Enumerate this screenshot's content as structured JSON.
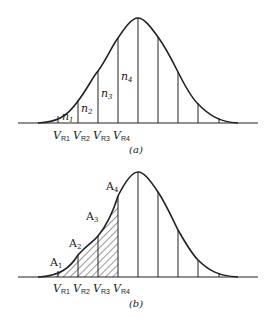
{
  "panel_a": {
    "caption": "(a)",
    "region_labels": [
      {
        "base": "n",
        "sub": "1"
      },
      {
        "base": "n",
        "sub": "2"
      },
      {
        "base": "n",
        "sub": "3"
      },
      {
        "base": "n",
        "sub": "4"
      }
    ],
    "axis_labels": [
      {
        "base": "V",
        "sub": "R1"
      },
      {
        "base": "V",
        "sub": "R2"
      },
      {
        "base": "V",
        "sub": "R3"
      },
      {
        "base": "V",
        "sub": "R4"
      }
    ]
  },
  "panel_b": {
    "caption": "(b)",
    "area_labels": [
      {
        "base": "A",
        "sub": "1"
      },
      {
        "base": "A",
        "sub": "2"
      },
      {
        "base": "A",
        "sub": "3"
      },
      {
        "base": "A",
        "sub": "4"
      }
    ],
    "axis_labels": [
      {
        "base": "V",
        "sub": "R1"
      },
      {
        "base": "V",
        "sub": "R2"
      },
      {
        "base": "V",
        "sub": "R3"
      },
      {
        "base": "V",
        "sub": "R4"
      }
    ]
  },
  "colors": {
    "line": "#222222",
    "background": "#ffffff"
  }
}
